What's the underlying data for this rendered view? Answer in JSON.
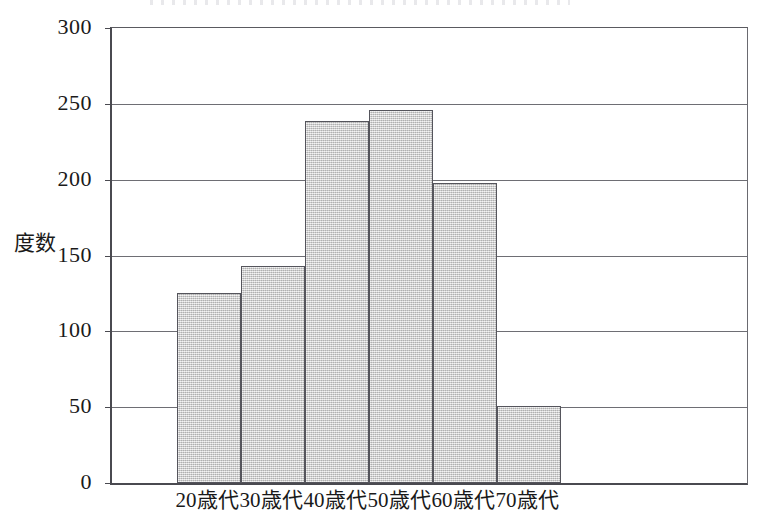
{
  "chart_data": {
    "type": "bar",
    "title": "",
    "xlabel": "",
    "ylabel": "度数",
    "categories": [
      "20歳代",
      "30歳代",
      "40歳代",
      "50歳代",
      "60歳代",
      "70歳代"
    ],
    "values": [
      125,
      143,
      239,
      246,
      198,
      51
    ],
    "ylim": [
      0,
      300
    ],
    "ytick_labels": [
      "300",
      "250",
      "200",
      "150",
      "100",
      "50",
      "0"
    ],
    "ytick_values": [
      300,
      250,
      200,
      150,
      100,
      50,
      0
    ],
    "ytick_step": 50,
    "grid": "horizontal",
    "legend": "none",
    "bar_style": "contiguous-histogram",
    "bar_fill": "#c9c9c9",
    "bar_border": "#55555c",
    "axis_color": "#4a4a50",
    "grid_color": "#6e6e74",
    "background": "#ffffff"
  }
}
